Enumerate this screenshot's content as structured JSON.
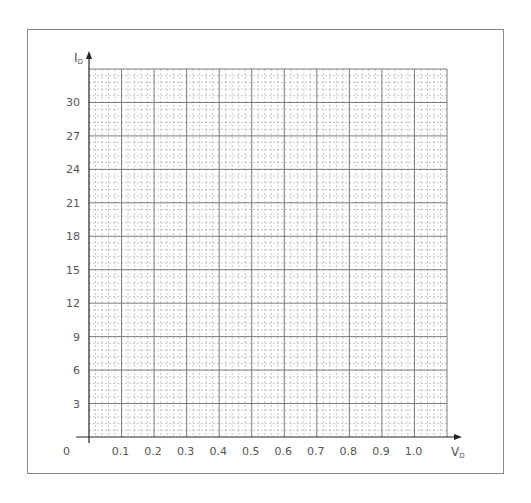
{
  "chart_data": {
    "type": "line",
    "title": "",
    "xlabel": "V",
    "xlabel_sub": "D",
    "ylabel": "I",
    "ylabel_sub": "D",
    "xlim": [
      0,
      1.1
    ],
    "ylim": [
      0,
      33
    ],
    "x_major_step": 0.1,
    "y_major_step": 3,
    "minor_divisions_per_major": 5,
    "grid": true,
    "origin_label": "0",
    "x_tick_labels": [
      "0.1",
      "0.2",
      "0.3",
      "0.4",
      "0.5",
      "0.6",
      "0.7",
      "0.8",
      "0.9",
      "1.0"
    ],
    "x_tick_values": [
      0.1,
      0.2,
      0.3,
      0.4,
      0.5,
      0.6,
      0.7,
      0.8,
      0.9,
      1.0
    ],
    "y_tick_labels": [
      "3",
      "6",
      "9",
      "12",
      "15",
      "18",
      "21",
      "24",
      "27",
      "30"
    ],
    "y_tick_values": [
      3,
      6,
      9,
      12,
      15,
      18,
      21,
      24,
      27,
      30
    ],
    "series": []
  },
  "colors": {
    "major_grid": "#7a7a7a",
    "minor_grid": "#b5b5b5",
    "axis": "#222222",
    "frame": "#8a8a8a",
    "text": "#555555"
  }
}
